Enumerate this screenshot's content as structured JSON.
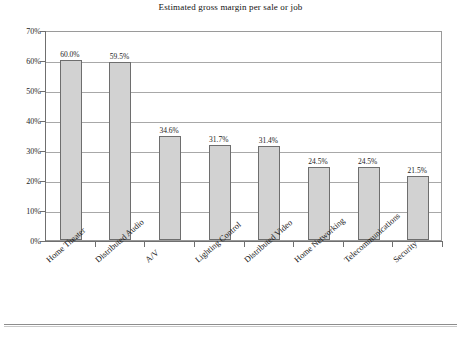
{
  "chart_data": {
    "type": "bar",
    "title": "Estimated gross margin per sale or job",
    "xlabel": "",
    "ylabel": "",
    "ylim": [
      0,
      70
    ],
    "grid": true,
    "legend": "none",
    "orientation": "vertical",
    "value_suffix": "%",
    "categories": [
      "Home Theater",
      "Distributed Audio",
      "A/V",
      "Lighting Control",
      "Distributed Video",
      "Home Networking",
      "Telecommunications",
      "Security"
    ],
    "values": [
      60.0,
      59.5,
      34.6,
      31.7,
      31.4,
      24.5,
      24.5,
      21.5
    ],
    "data_labels": [
      "60.0%",
      "59.5%",
      "34.6%",
      "31.7%",
      "31.4%",
      "24.5%",
      "24.5%",
      "21.5%"
    ],
    "y_ticks": [
      0,
      10,
      20,
      30,
      40,
      50,
      60,
      70
    ],
    "y_tick_labels": [
      "0%",
      "10%",
      "20%",
      "30%",
      "40%",
      "50%",
      "60%",
      "70%"
    ],
    "colors": {
      "bar_fill": "#d2d2d2",
      "bar_border": "#6e6e6e",
      "gridline": "#a8a8a8",
      "axis": "#6f6f6f",
      "plot_border": "#9a9a9a",
      "text": "#1c1c1c",
      "background": "#ffffff"
    }
  }
}
